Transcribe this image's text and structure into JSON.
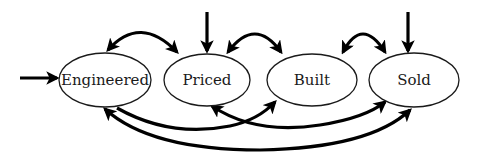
{
  "diagram": {
    "type": "state-transition",
    "nodes": [
      {
        "id": "engineered",
        "label": "Engineered",
        "cx": 105,
        "cy": 80,
        "rx": 46,
        "ry": 27
      },
      {
        "id": "priced",
        "label": "Priced",
        "cx": 207,
        "cy": 80,
        "rx": 43,
        "ry": 26
      },
      {
        "id": "built",
        "label": "Built",
        "cx": 312,
        "cy": 80,
        "rx": 45,
        "ry": 26
      },
      {
        "id": "sold",
        "label": "Sold",
        "cx": 414,
        "cy": 80,
        "rx": 45,
        "ry": 27
      }
    ],
    "entry_arrows": [
      {
        "to": "engineered",
        "direction": "from-left"
      },
      {
        "to": "priced",
        "direction": "from-top"
      },
      {
        "to": "sold",
        "direction": "from-top"
      }
    ],
    "edges": [
      {
        "from": "engineered",
        "to": "priced",
        "bidirectional": true,
        "position": "top"
      },
      {
        "from": "priced",
        "to": "built",
        "bidirectional": true,
        "position": "top"
      },
      {
        "from": "built",
        "to": "sold",
        "bidirectional": true,
        "position": "top"
      },
      {
        "from": "engineered",
        "to": "built",
        "bidirectional": false,
        "position": "bottom"
      },
      {
        "from": "priced",
        "to": "sold",
        "bidirectional": true,
        "position": "bottom"
      },
      {
        "from": "engineered",
        "to": "sold",
        "bidirectional": true,
        "position": "bottom"
      }
    ],
    "colors": {
      "stroke": "#000000",
      "fill": "#ffffff",
      "text": "#1a1a1a"
    }
  }
}
